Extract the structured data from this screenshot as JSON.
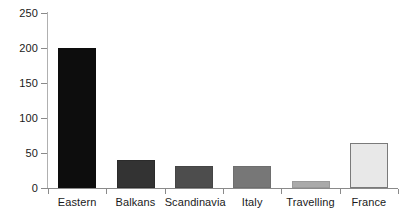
{
  "chart_data": {
    "type": "bar",
    "title": "",
    "subtitle": "",
    "xlabel": "",
    "ylabel": "",
    "categories": [
      "Eastern",
      "Balkans",
      "Scandinavia",
      "Italy",
      "Travelling",
      "France"
    ],
    "values": [
      200,
      40,
      32,
      32,
      10,
      64
    ],
    "ylim": [
      0,
      250
    ],
    "yticks": [
      0,
      50,
      100,
      150,
      200,
      250
    ],
    "ytick_labels": [
      "0",
      "50",
      "100",
      "150",
      "200",
      "250"
    ],
    "grid": false,
    "legend": false,
    "bar_colors": [
      "#0d0d0d",
      "#333333",
      "#4d4d4d",
      "#777777",
      "#aaaaaa",
      "#e8e8e8"
    ],
    "bar_edge_colors": [
      "#0d0d0d",
      "#2b2b2b",
      "#454545",
      "#6e6e6e",
      "#9a9a9a",
      "#7a7a7a"
    ],
    "series": [
      {
        "name": "Count",
        "values": [
          200,
          40,
          32,
          32,
          10,
          64
        ]
      }
    ]
  }
}
